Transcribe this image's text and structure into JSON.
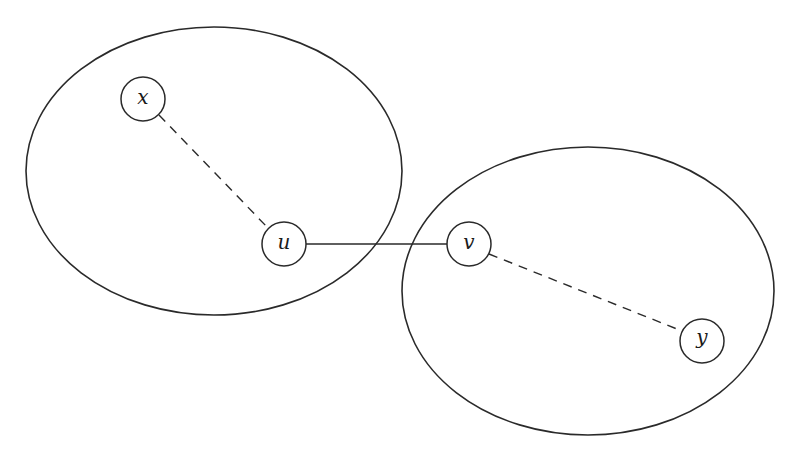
{
  "diagram": {
    "type": "graph",
    "colors": {
      "stroke": "#2a2a2a",
      "background": "#ffffff"
    },
    "clusters": [
      {
        "id": "left",
        "cx": 214,
        "cy": 171,
        "rx": 188,
        "ry": 144,
        "contains": [
          "x",
          "u"
        ]
      },
      {
        "id": "right",
        "cx": 588,
        "cy": 291,
        "rx": 186,
        "ry": 144,
        "contains": [
          "v",
          "y"
        ]
      }
    ],
    "nodes": [
      {
        "id": "x",
        "label": "x",
        "cx": 143,
        "cy": 99,
        "r": 22
      },
      {
        "id": "u",
        "label": "u",
        "cx": 284,
        "cy": 244,
        "r": 22
      },
      {
        "id": "v",
        "label": "v",
        "cx": 469,
        "cy": 244,
        "r": 22
      },
      {
        "id": "y",
        "label": "y",
        "cx": 702,
        "cy": 341,
        "r": 22
      }
    ],
    "edges": [
      {
        "from": "x",
        "to": "u",
        "style": "dashed"
      },
      {
        "from": "u",
        "to": "v",
        "style": "solid"
      },
      {
        "from": "v",
        "to": "y",
        "style": "dashed"
      }
    ]
  }
}
